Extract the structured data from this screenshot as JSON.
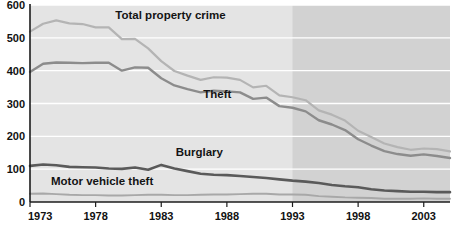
{
  "chart_data": {
    "type": "line",
    "title": "",
    "subtitle": "",
    "xlabel": "",
    "ylabel": "",
    "xlim": [
      1973,
      2005
    ],
    "ylim": [
      0,
      600
    ],
    "grid": true,
    "legend_position": "inline-annotations",
    "y_ticks": [
      "0",
      "100",
      "200",
      "300",
      "400",
      "500",
      "600"
    ],
    "y_tick_values": [
      0,
      100,
      200,
      300,
      400,
      500,
      600
    ],
    "x_ticks": [
      "1973",
      "1978",
      "1983",
      "1988",
      "1993",
      "1998",
      "2003"
    ],
    "x_tick_values": [
      1973,
      1978,
      1983,
      1988,
      1993,
      1998,
      2003
    ],
    "shaded_region": {
      "from": 1993,
      "to": 2005,
      "color": "#d2d2d2"
    },
    "plot_background": "#e4e4e4",
    "gridline_color": "#ffffff",
    "axis_color": "#1c1c1c",
    "x": [
      1973,
      1974,
      1975,
      1976,
      1977,
      1978,
      1979,
      1980,
      1981,
      1982,
      1983,
      1984,
      1985,
      1986,
      1987,
      1988,
      1989,
      1990,
      1991,
      1992,
      1993,
      1994,
      1995,
      1996,
      1997,
      1998,
      1999,
      2000,
      2001,
      2002,
      2003,
      2004,
      2005
    ],
    "series": [
      {
        "name": "Total property crime",
        "color": "#b4b4b4",
        "label_x": 1979.5,
        "label_y": 556,
        "values": [
          519,
          543,
          553,
          544,
          542,
          532,
          532,
          496,
          497,
          468,
          429,
          399,
          385,
          372,
          380,
          379,
          372,
          349,
          354,
          325,
          319,
          310,
          279,
          266,
          248,
          217,
          198,
          178,
          167,
          159,
          163,
          161,
          154
        ]
      },
      {
        "name": "Theft",
        "color": "#8c8c8c",
        "label_x": 1986.2,
        "label_y": 318,
        "values": [
          396,
          421,
          425,
          424,
          423,
          424,
          424,
          400,
          410,
          409,
          377,
          355,
          344,
          334,
          339,
          337,
          334,
          314,
          318,
          292,
          287,
          276,
          249,
          236,
          219,
          191,
          172,
          155,
          146,
          141,
          145,
          140,
          134
        ]
      },
      {
        "name": "Burglary",
        "color": "#5a5a5a",
        "label_x": 1984.1,
        "label_y": 140,
        "values": [
          110,
          114,
          112,
          107,
          106,
          105,
          102,
          101,
          105,
          98,
          113,
          102,
          94,
          86,
          83,
          82,
          79,
          76,
          73,
          69,
          65,
          62,
          58,
          52,
          48,
          45,
          39,
          35,
          33,
          31,
          31,
          30,
          30
        ]
      },
      {
        "name": "Motor vehicle theft",
        "color": "#a8a8a8",
        "label_x": 1974.6,
        "label_y": 52,
        "values": [
          25,
          26,
          24,
          22,
          21,
          21,
          20,
          20,
          21,
          22,
          22,
          21,
          21,
          22,
          23,
          23,
          24,
          25,
          25,
          23,
          23,
          22,
          18,
          16,
          14,
          13,
          12,
          10,
          10,
          10,
          11,
          10,
          10
        ]
      }
    ]
  }
}
